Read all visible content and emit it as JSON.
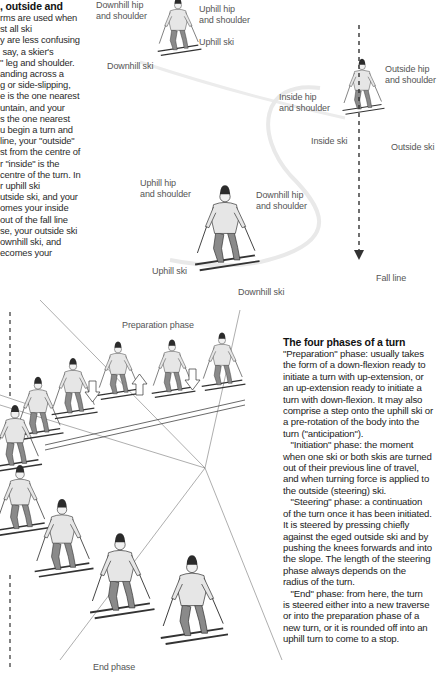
{
  "intro": {
    "heading": ", outside and",
    "lines": [
      "rms are used when",
      "st all ski",
      "y are less confusing",
      " say, a skier's",
      "\" leg and shoulder.",
      "anding across a",
      "g or side-slipping,",
      "e is the one nearest",
      "untain, and your",
      "s the one nearest",
      "u begin a turn and",
      "line, your \"outside\"",
      "st from the centre of",
      "r \"inside\" is the",
      "centre of the turn. In",
      "r uphill ski",
      "utside ski, and your",
      "omes your inside",
      "out of the fall line",
      "se, your outside ski",
      "ownhill ski, and",
      "ecomes your"
    ]
  },
  "top_labels": {
    "downhill_hip_top": "Downhill hip\nand shoulder",
    "uphill_hip_top": "Uphill hip\nand shoulder",
    "uphill_ski_top": "Uphill ski",
    "downhill_ski_top": "Downhill ski",
    "outside_hip": "Outside hip\nand shoulder",
    "inside_hip": "Inside hip\nand shoulder",
    "inside_ski": "Inside ski",
    "outside_ski": "Outside ski",
    "uphill_hip_mid": "Uphill hip\nand shoulder",
    "downhill_hip_mid": "Downhill hip\nand shoulder",
    "uphill_ski_mid": "Uphill ski",
    "downhill_ski_mid": "Downhill ski",
    "fall_line": "Fall line"
  },
  "sequence_labels": {
    "preparation": "Preparation phase",
    "end": "End phase"
  },
  "phases": {
    "heading": "The four phases of a turn",
    "lines": [
      "\"Preparation\" phase: usually takes",
      "the form of a down-flexion ready to",
      "initiate a turn with up-extension, or",
      "an up-extension ready to initiate a",
      "turn with down-flexion. It may also",
      "comprise a step onto the uphill ski or",
      "a pre-rotation of the body into the",
      "turn (\"anticipation\").",
      "   \"Initiation\" phase: the moment",
      "when one ski or both skis are turned",
      "out of their previous line of travel,",
      "and when turning force is applied to",
      "the outside (steering) ski.",
      "   \"Steering\" phase: a continuation",
      "of the turn once it has been initiated.",
      "It is steered by pressing chiefly",
      "against the eged outside ski and by",
      "pushing the knees forwards and into",
      "the slope. The length of the steering",
      "phase always depends on the",
      "radius of the turn.",
      "   \"End\" phase: from here, the turn",
      "is steered either into a new traverse",
      "or into the preparation phase of a",
      "new turn, or it is rounded off into an",
      "uphill turn to come to a stop."
    ]
  },
  "colors": {
    "text": "#2a2a2a",
    "label": "#555555",
    "sweater": "#e6e6e6",
    "trousers": "#8a8a8a",
    "hat": "#2b2b2b",
    "track": "#e8e8e8"
  }
}
